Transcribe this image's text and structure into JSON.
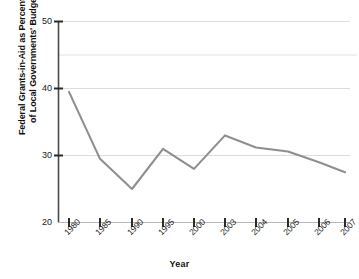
{
  "chart_data": {
    "type": "line",
    "title": "",
    "xlabel": "Year",
    "ylabel": "Federal Grants-in-Aid as Percentage of Local Governments' Budget",
    "ylabel_line1": "Federal Grants-in-Aid as Percentage",
    "ylabel_line2": "of Local Governments' Budget",
    "categories": [
      "1980",
      "1985",
      "1990",
      "1995",
      "2000",
      "2003",
      "2004",
      "2005",
      "2006",
      "2007"
    ],
    "values": [
      39.5,
      29.5,
      25.0,
      31.0,
      28.0,
      33.0,
      31.2,
      30.6,
      29.0,
      27.5
    ],
    "series": [
      {
        "name": "Federal Grants-in-Aid as Percentage of Local Governments' Budget",
        "values": [
          39.5,
          29.5,
          25.0,
          31.0,
          28.0,
          33.0,
          31.2,
          30.6,
          29.0,
          27.5
        ]
      }
    ],
    "ylim": [
      20,
      50
    ],
    "ytick_labels": [
      "20",
      "30",
      "40",
      "50"
    ],
    "ytick_values": [
      20,
      30,
      40,
      50
    ],
    "gridline_values": [
      30,
      40,
      45,
      50
    ],
    "grid": true,
    "legend": "none",
    "line_color": "#8f8f8f",
    "gridline_color": "#d9d9d9",
    "axis_color": "#4a4a4a",
    "text_color": "#111111",
    "background_color": "#ffffff"
  },
  "axes": {
    "x_title": "Year",
    "y_title_line1": "Federal Grants-in-Aid as Percentage",
    "y_title_line2": "of Local Governments' Budget",
    "y_ticks": [
      {
        "label": "50",
        "value": 50
      },
      {
        "label": "40",
        "value": 40
      },
      {
        "label": "30",
        "value": 30
      },
      {
        "label": "20",
        "value": 20
      }
    ],
    "x_ticks": [
      {
        "label": "1980"
      },
      {
        "label": "1985"
      },
      {
        "label": "1990"
      },
      {
        "label": "1995"
      },
      {
        "label": "2000"
      },
      {
        "label": "2003"
      },
      {
        "label": "2004"
      },
      {
        "label": "2005"
      },
      {
        "label": "2006"
      },
      {
        "label": "2007"
      }
    ]
  }
}
